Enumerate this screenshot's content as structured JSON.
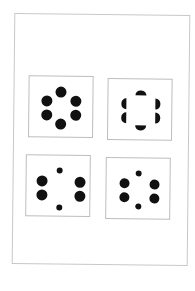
{
  "figure": {
    "panels": [
      {
        "id": "top-left",
        "content": "six full dots in hexagonal ring"
      },
      {
        "id": "top-right",
        "content": "six half-disc shapes forming illusory square"
      },
      {
        "id": "bottom-left",
        "content": "four large dots and two small dots"
      },
      {
        "id": "bottom-right",
        "content": "four large dots and two small dots, tighter"
      }
    ]
  },
  "colors": {
    "ink": "#111111",
    "frame": "#bdbdbd",
    "background": "#ffffff"
  }
}
